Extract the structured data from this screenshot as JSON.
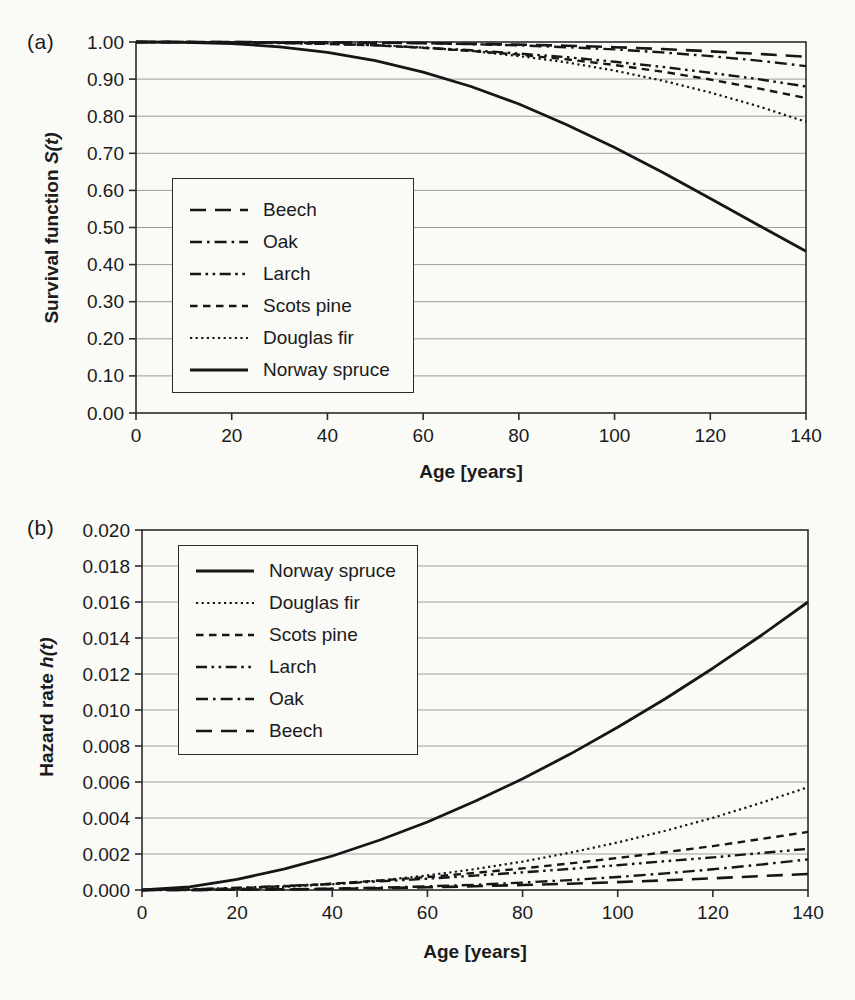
{
  "colors": {
    "background": "#fafaf7",
    "ink": "#161616",
    "grid": "#9e9e9e",
    "frame": "#2b2b2b"
  },
  "chart_data": [
    {
      "type": "line",
      "panel_tag": "(a)",
      "title": "",
      "xlabel": "Age [years]",
      "ylabel": "Survival function S(t)",
      "ylabel_prefix": "Survival function",
      "ylabel_math": "S(t)",
      "xlim": [
        0,
        140
      ],
      "ylim": [
        0,
        1.0
      ],
      "grid": "horizontal",
      "legend_position": "inside lower-left",
      "x_tick_labels": [
        "0",
        "20",
        "40",
        "60",
        "80",
        "100",
        "120",
        "140"
      ],
      "y_tick_labels": [
        "1.00",
        "0.90",
        "0.80",
        "0.70",
        "0.60",
        "0.50",
        "0.40",
        "0.30",
        "0.20",
        "0.10",
        "0.00"
      ],
      "x": [
        0,
        10,
        20,
        30,
        40,
        50,
        60,
        70,
        80,
        90,
        100,
        110,
        120,
        130,
        140
      ],
      "series": [
        {
          "name": "Beech",
          "style": "longdash",
          "values": [
            1.0,
            1.0,
            1.0,
            0.999,
            0.999,
            0.998,
            0.997,
            0.995,
            0.993,
            0.99,
            0.986,
            0.981,
            0.975,
            0.968,
            0.96
          ]
        },
        {
          "name": "Oak",
          "style": "dashdot",
          "values": [
            1.0,
            1.0,
            1.0,
            0.999,
            0.999,
            0.998,
            0.997,
            0.994,
            0.991,
            0.986,
            0.98,
            0.972,
            0.962,
            0.95,
            0.935
          ]
        },
        {
          "name": "Larch",
          "style": "dashdotdot",
          "values": [
            1.0,
            1.0,
            0.999,
            0.997,
            0.995,
            0.991,
            0.985,
            0.978,
            0.969,
            0.959,
            0.947,
            0.933,
            0.917,
            0.9,
            0.88
          ]
        },
        {
          "name": "Scots pine",
          "style": "dash",
          "values": [
            1.0,
            1.0,
            0.999,
            0.998,
            0.995,
            0.991,
            0.984,
            0.976,
            0.966,
            0.953,
            0.938,
            0.92,
            0.899,
            0.875,
            0.849
          ]
        },
        {
          "name": "Douglas fir",
          "style": "dot",
          "values": [
            1.0,
            1.0,
            1.0,
            0.999,
            0.996,
            0.992,
            0.985,
            0.976,
            0.962,
            0.945,
            0.923,
            0.896,
            0.864,
            0.827,
            0.785
          ]
        },
        {
          "name": "Norway spruce",
          "style": "solid",
          "values": [
            1.0,
            0.999,
            0.996,
            0.987,
            0.972,
            0.95,
            0.919,
            0.88,
            0.833,
            0.777,
            0.716,
            0.649,
            0.578,
            0.507,
            0.436
          ]
        }
      ]
    },
    {
      "type": "line",
      "panel_tag": "(b)",
      "title": "",
      "xlabel": "Age [years]",
      "ylabel": "Hazard rate h(t)",
      "ylabel_prefix": "Hazard rate",
      "ylabel_math": "h(t)",
      "xlim": [
        0,
        140
      ],
      "ylim": [
        0,
        0.02
      ],
      "grid": "horizontal",
      "legend_position": "inside upper-left",
      "x_tick_labels": [
        "0",
        "20",
        "40",
        "60",
        "80",
        "100",
        "120",
        "140"
      ],
      "y_tick_labels": [
        "0.020",
        "0.018",
        "0.016",
        "0.014",
        "0.012",
        "0.010",
        "0.008",
        "0.006",
        "0.004",
        "0.002",
        "0.000"
      ],
      "x": [
        0,
        10,
        20,
        30,
        40,
        50,
        60,
        70,
        80,
        90,
        100,
        110,
        120,
        130,
        140
      ],
      "series": [
        {
          "name": "Norway spruce",
          "style": "solid",
          "values": [
            0,
            0.00018,
            0.00059,
            0.00117,
            0.00189,
            0.00278,
            0.00378,
            0.00493,
            0.00618,
            0.00755,
            0.00904,
            0.01062,
            0.01232,
            0.01411,
            0.016
          ]
        },
        {
          "name": "Douglas fir",
          "style": "dot",
          "values": [
            0,
            1e-05,
            6e-05,
            0.00017,
            0.00032,
            0.00053,
            0.00081,
            0.00116,
            0.00158,
            0.00207,
            0.00264,
            0.00329,
            0.00401,
            0.00483,
            0.00571
          ]
        },
        {
          "name": "Scots pine",
          "style": "dash",
          "values": [
            0,
            3e-05,
            0.0001,
            0.00021,
            0.00035,
            0.00053,
            0.00072,
            0.00095,
            0.0012,
            0.00148,
            0.00178,
            0.0021,
            0.00244,
            0.00283,
            0.00323
          ]
        },
        {
          "name": "Larch",
          "style": "dashdotdot",
          "values": [
            0,
            4e-05,
            0.00012,
            0.00022,
            0.00034,
            0.00048,
            0.00063,
            0.0008,
            0.00098,
            0.00117,
            0.00138,
            0.0016,
            0.00181,
            0.00205,
            0.00229
          ]
        },
        {
          "name": "Oak",
          "style": "dashdot",
          "values": [
            0,
            2e-06,
            1e-05,
            3e-05,
            7e-05,
            0.00013,
            0.0002,
            0.00029,
            0.00041,
            0.00055,
            0.00072,
            0.00092,
            0.00115,
            0.00141,
            0.0017
          ]
        },
        {
          "name": "Beech",
          "style": "longdash",
          "values": [
            0,
            2e-06,
            2e-05,
            4e-05,
            6e-05,
            0.0001,
            0.00015,
            0.00021,
            0.00028,
            0.00035,
            0.00044,
            0.00054,
            0.00065,
            0.00077,
            0.00089
          ]
        }
      ]
    }
  ]
}
